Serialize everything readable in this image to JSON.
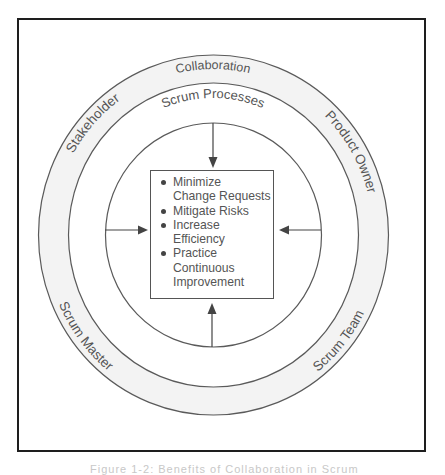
{
  "diagram": {
    "outer_ring_label": "Collaboration",
    "roles": {
      "top_left": "Stakeholder",
      "top_right": "Product Owner",
      "bottom_left": "Scrum Master",
      "bottom_right": "Scrum Team"
    },
    "middle_ring_label": "Scrum Processes",
    "benefits": [
      {
        "label": "Minimize Change Requests"
      },
      {
        "label": "Mitigate Risks"
      },
      {
        "label": "Increase Efficiency"
      },
      {
        "label": "Practice Continuous Improvement"
      }
    ],
    "benefit_lines": [
      [
        "Minimize",
        "Change Requests"
      ],
      [
        "Mitigate Risks"
      ],
      [
        "Increase",
        "Efficiency"
      ],
      [
        "Practice",
        "Continuous",
        "Improvement"
      ]
    ],
    "colors": {
      "frame": "#1e1e1e",
      "lines": "#555555",
      "ring_fill": "#f3f3f3",
      "text": "#555555"
    }
  },
  "caption": "Figure 1-2: Benefits of Collaboration in Scrum"
}
